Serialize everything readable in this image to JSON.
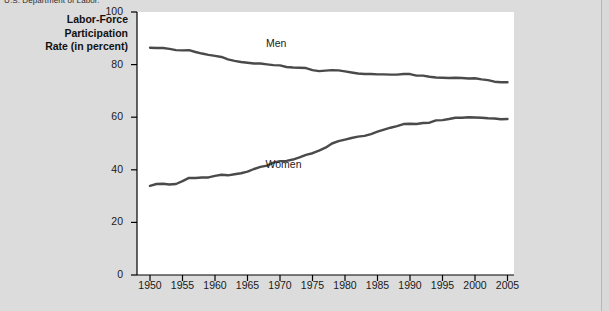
{
  "figure": {
    "source_note": "U.S. Department of Labor.",
    "axis_title_lines": [
      "Labor-Force",
      "Participation",
      "Rate (in percent)"
    ],
    "colors": {
      "page_background": "#d9d9d9",
      "figure_background": "#dcdcdc",
      "plot_background": "#ffffff",
      "line": "#4a4a4a",
      "axis": "#000000",
      "text": "#1a1a1a"
    }
  },
  "chart_data": {
    "type": "line",
    "title": "",
    "subtitle": "",
    "xlabel": "",
    "ylabel": "Labor-Force Participation Rate (in percent)",
    "xlim": [
      1948,
      2006
    ],
    "ylim": [
      0,
      100
    ],
    "grid": false,
    "legend_position": "inline-annotations",
    "xticks": [
      1950,
      1955,
      1960,
      1965,
      1970,
      1975,
      1980,
      1985,
      1990,
      1995,
      2000,
      2005
    ],
    "xtick_labels": [
      "1950",
      "1955",
      "1960",
      "1965",
      "1970",
      "1975",
      "1980",
      "1985",
      "1990",
      "1995",
      "2000",
      "2005"
    ],
    "yticks": [
      0,
      20,
      40,
      60,
      80,
      100
    ],
    "ytick_labels": [
      "0",
      "20",
      "40",
      "60",
      "80",
      "100"
    ],
    "x": [
      1950,
      1951,
      1952,
      1953,
      1954,
      1955,
      1956,
      1957,
      1958,
      1959,
      1960,
      1961,
      1962,
      1963,
      1964,
      1965,
      1966,
      1967,
      1968,
      1969,
      1970,
      1971,
      1972,
      1973,
      1974,
      1975,
      1976,
      1977,
      1978,
      1979,
      1980,
      1981,
      1982,
      1983,
      1984,
      1985,
      1986,
      1987,
      1988,
      1989,
      1990,
      1991,
      1992,
      1993,
      1994,
      1995,
      1996,
      1997,
      1998,
      1999,
      2000,
      2001,
      2002,
      2003,
      2004,
      2005
    ],
    "series": [
      {
        "name": "Men",
        "label_x": 1970,
        "label_y": 88,
        "values": [
          86.4,
          86.3,
          86.3,
          86.0,
          85.5,
          85.4,
          85.5,
          84.8,
          84.2,
          83.7,
          83.3,
          82.9,
          82.0,
          81.4,
          81.0,
          80.7,
          80.4,
          80.4,
          80.1,
          79.8,
          79.7,
          79.1,
          78.9,
          78.8,
          78.7,
          77.9,
          77.5,
          77.7,
          77.9,
          77.8,
          77.4,
          77.0,
          76.6,
          76.4,
          76.4,
          76.3,
          76.3,
          76.2,
          76.2,
          76.4,
          76.4,
          75.8,
          75.8,
          75.4,
          75.1,
          75.0,
          74.9,
          75.0,
          74.9,
          74.7,
          74.8,
          74.4,
          74.1,
          73.5,
          73.3,
          73.3
        ]
      },
      {
        "name": "Women",
        "label_x": 1971,
        "label_y": 42,
        "values": [
          33.9,
          34.6,
          34.7,
          34.4,
          34.6,
          35.7,
          36.9,
          36.9,
          37.1,
          37.1,
          37.7,
          38.1,
          37.9,
          38.3,
          38.7,
          39.3,
          40.3,
          41.1,
          41.6,
          42.7,
          43.3,
          43.4,
          43.9,
          44.7,
          45.7,
          46.3,
          47.3,
          48.4,
          50.0,
          50.9,
          51.5,
          52.1,
          52.6,
          52.9,
          53.6,
          54.5,
          55.3,
          56.0,
          56.6,
          57.4,
          57.5,
          57.4,
          57.8,
          57.9,
          58.8,
          58.9,
          59.3,
          59.8,
          59.8,
          60.0,
          59.9,
          59.8,
          59.6,
          59.5,
          59.2,
          59.3
        ]
      }
    ]
  }
}
